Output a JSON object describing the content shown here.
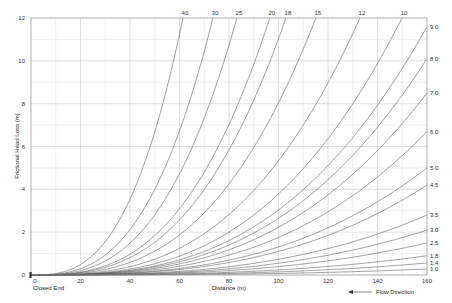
{
  "chart_data": {
    "type": "line",
    "title": "",
    "xlabel": "Distance (m)",
    "ylabel": "Frictional Head Loss (m)",
    "xlim": [
      0,
      160
    ],
    "ylim": [
      0,
      12
    ],
    "x_ticks": [
      0,
      20,
      40,
      60,
      80,
      100,
      120,
      140,
      160
    ],
    "y_ticks": [
      0,
      2,
      4,
      6,
      8,
      10,
      12
    ],
    "grid": true,
    "exponent": 2.85,
    "annotations": {
      "origin": "Closed End",
      "flow": "Flow Direction"
    },
    "series_top": [
      {
        "name": "40",
        "exit_distance": 61.4
      },
      {
        "name": "30",
        "exit_distance": 73.5
      },
      {
        "name": "25",
        "exit_distance": 83.2
      },
      {
        "name": "20",
        "exit_distance": 96.5
      },
      {
        "name": "18",
        "exit_distance": 103.0
      },
      {
        "name": "15",
        "exit_distance": 115.1
      },
      {
        "name": "12",
        "exit_distance": 132.9
      },
      {
        "name": "10",
        "exit_distance": 149.9
      }
    ],
    "series_right": [
      {
        "name": "9.0",
        "value_at_160": 11.6
      },
      {
        "name": "8.0",
        "value_at_160": 10.1
      },
      {
        "name": "7.0",
        "value_at_160": 8.5
      },
      {
        "name": "6.0",
        "value_at_160": 6.7
      },
      {
        "name": "5.0",
        "value_at_160": 5.0
      },
      {
        "name": "4.5",
        "value_at_160": 4.2
      },
      {
        "name": "3.5",
        "value_at_160": 2.8
      },
      {
        "name": "3.0",
        "value_at_160": 2.1
      },
      {
        "name": "2.5",
        "value_at_160": 1.5
      },
      {
        "name": "1.8",
        "value_at_160": 0.9
      },
      {
        "name": "1.4",
        "value_at_160": 0.56
      },
      {
        "name": "1.0",
        "value_at_160": 0.28
      }
    ]
  }
}
